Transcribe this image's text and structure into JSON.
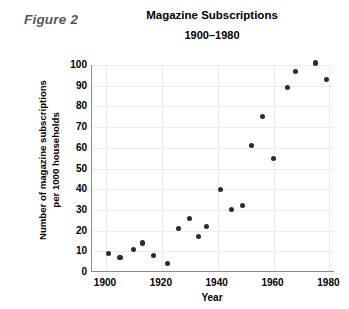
{
  "figure": {
    "label": "Figure 2"
  },
  "chart_data": {
    "type": "scatter",
    "title": "Magazine Subscriptions",
    "subtitle": "1900–1980",
    "xlabel": "Year",
    "ylabel_line1": "Number of magazine subscriptions",
    "ylabel_line2": "per 1000 households",
    "xlim": [
      1895,
      1982
    ],
    "ylim": [
      0,
      100
    ],
    "grid": true,
    "legend": "none",
    "marker_color": "#2b2b2b",
    "axis_color": "#8d8d8f",
    "grid_color": "#ececec",
    "xticks": [
      1900,
      1920,
      1940,
      1960,
      1980
    ],
    "yticks": [
      0,
      10,
      20,
      30,
      40,
      50,
      60,
      70,
      80,
      90,
      100
    ],
    "x": [
      1901,
      1905,
      1910,
      1913,
      1917,
      1922,
      1926,
      1930,
      1933,
      1936,
      1941,
      1945,
      1949,
      1952,
      1956,
      1960,
      1965,
      1968,
      1975,
      1979
    ],
    "y": [
      9,
      7,
      11,
      14,
      8,
      4,
      21,
      26,
      17,
      22,
      40,
      30,
      32,
      61,
      75,
      55,
      89,
      97,
      101,
      93
    ],
    "points": [
      {
        "x": 1901,
        "y": 9
      },
      {
        "x": 1905,
        "y": 7
      },
      {
        "x": 1910,
        "y": 11
      },
      {
        "x": 1913,
        "y": 14
      },
      {
        "x": 1917,
        "y": 8
      },
      {
        "x": 1922,
        "y": 4
      },
      {
        "x": 1926,
        "y": 21
      },
      {
        "x": 1930,
        "y": 26
      },
      {
        "x": 1933,
        "y": 17
      },
      {
        "x": 1936,
        "y": 22
      },
      {
        "x": 1941,
        "y": 40
      },
      {
        "x": 1945,
        "y": 30
      },
      {
        "x": 1949,
        "y": 32
      },
      {
        "x": 1952,
        "y": 61
      },
      {
        "x": 1956,
        "y": 75
      },
      {
        "x": 1960,
        "y": 55
      },
      {
        "x": 1965,
        "y": 89
      },
      {
        "x": 1968,
        "y": 97
      },
      {
        "x": 1975,
        "y": 101
      },
      {
        "x": 1979,
        "y": 93
      }
    ]
  }
}
